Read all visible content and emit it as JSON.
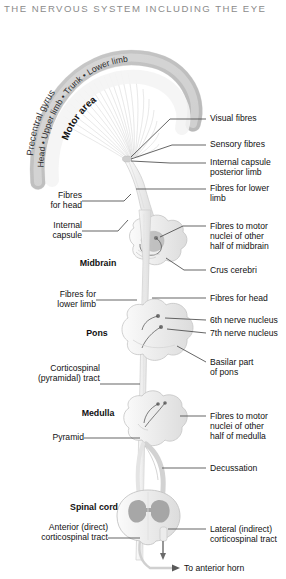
{
  "title": "THE NERVOUS SYSTEM INCLUDING THE EYE",
  "cortex": {
    "outer_arc": "Precentral gyrus",
    "middle_arc": "Head • Upper limb • Trunk • Lower limb",
    "inner_arc": "Motor area"
  },
  "region_labels": {
    "midbrain": "Midbrain",
    "pons": "Pons",
    "medulla": "Medulla",
    "spinal_cord": "Spinal cord"
  },
  "right_labels": [
    {
      "id": "visual-fibres",
      "line1": "Visual fibres",
      "line2": ""
    },
    {
      "id": "sensory-fibres",
      "line1": "Sensory fibres",
      "line2": ""
    },
    {
      "id": "internal-capsule-posterior-limb",
      "line1": "Internal capsule",
      "line2": "posterior limb"
    },
    {
      "id": "fibres-for-lower-limb",
      "line1": "Fibres for lower",
      "line2": "limb"
    },
    {
      "id": "fibres-to-motor-nuclei-midbrain",
      "line1": "Fibres to motor",
      "line2": "nuclei of other",
      "line3": "half of midbrain"
    },
    {
      "id": "crus-cerebri",
      "line1": "Crus cerebri",
      "line2": ""
    },
    {
      "id": "fibres-for-head-right",
      "line1": "Fibres for head",
      "line2": ""
    },
    {
      "id": "sixth-nerve-nucleus",
      "line1": "6th nerve nucleus",
      "line2": ""
    },
    {
      "id": "seventh-nerve-nucleus",
      "line1": "7th nerve nucleus",
      "line2": ""
    },
    {
      "id": "basilar-part-of-pons",
      "line1": "Basilar part",
      "line2": "of pons"
    },
    {
      "id": "fibres-to-motor-nuclei-medulla",
      "line1": "Fibres to motor",
      "line2": "nuclei of other",
      "line3": "half of medulla"
    },
    {
      "id": "decussation",
      "line1": "Decussation",
      "line2": ""
    },
    {
      "id": "lateral-corticospinal-tract",
      "line1": "Lateral (indirect)",
      "line2": "corticospinal tract"
    },
    {
      "id": "to-anterior-horn",
      "line1": "To anterior horn",
      "line2": ""
    }
  ],
  "left_labels": [
    {
      "id": "fibres-for-head-left",
      "line1": "Fibres",
      "line2": "for head"
    },
    {
      "id": "internal-capsule",
      "line1": "Internal",
      "line2": "capsule"
    },
    {
      "id": "fibres-for-lower-limb-left",
      "line1": "Fibres for",
      "line2": "lower limb"
    },
    {
      "id": "corticospinal-pyramidal-tract",
      "line1": "Corticospinal",
      "line2": "(pyramidal) tract"
    },
    {
      "id": "pyramid",
      "line1": "Pyramid",
      "line2": ""
    },
    {
      "id": "anterior-corticospinal-tract",
      "line1": "Anterior (direct)",
      "line2": "corticospinal tract"
    }
  ],
  "colors": {
    "title": "#8b8b8b",
    "leader_line": "#4a4a4a",
    "cortex_band": "#c9c9c9",
    "tissue_fill": "#f1f1f1",
    "tissue_stroke": "#c4c4c4",
    "gray_matter": "#a8a8a8",
    "nucleus": "#8e8e8e",
    "tract": "#f7f7f7",
    "text": "#111111"
  }
}
